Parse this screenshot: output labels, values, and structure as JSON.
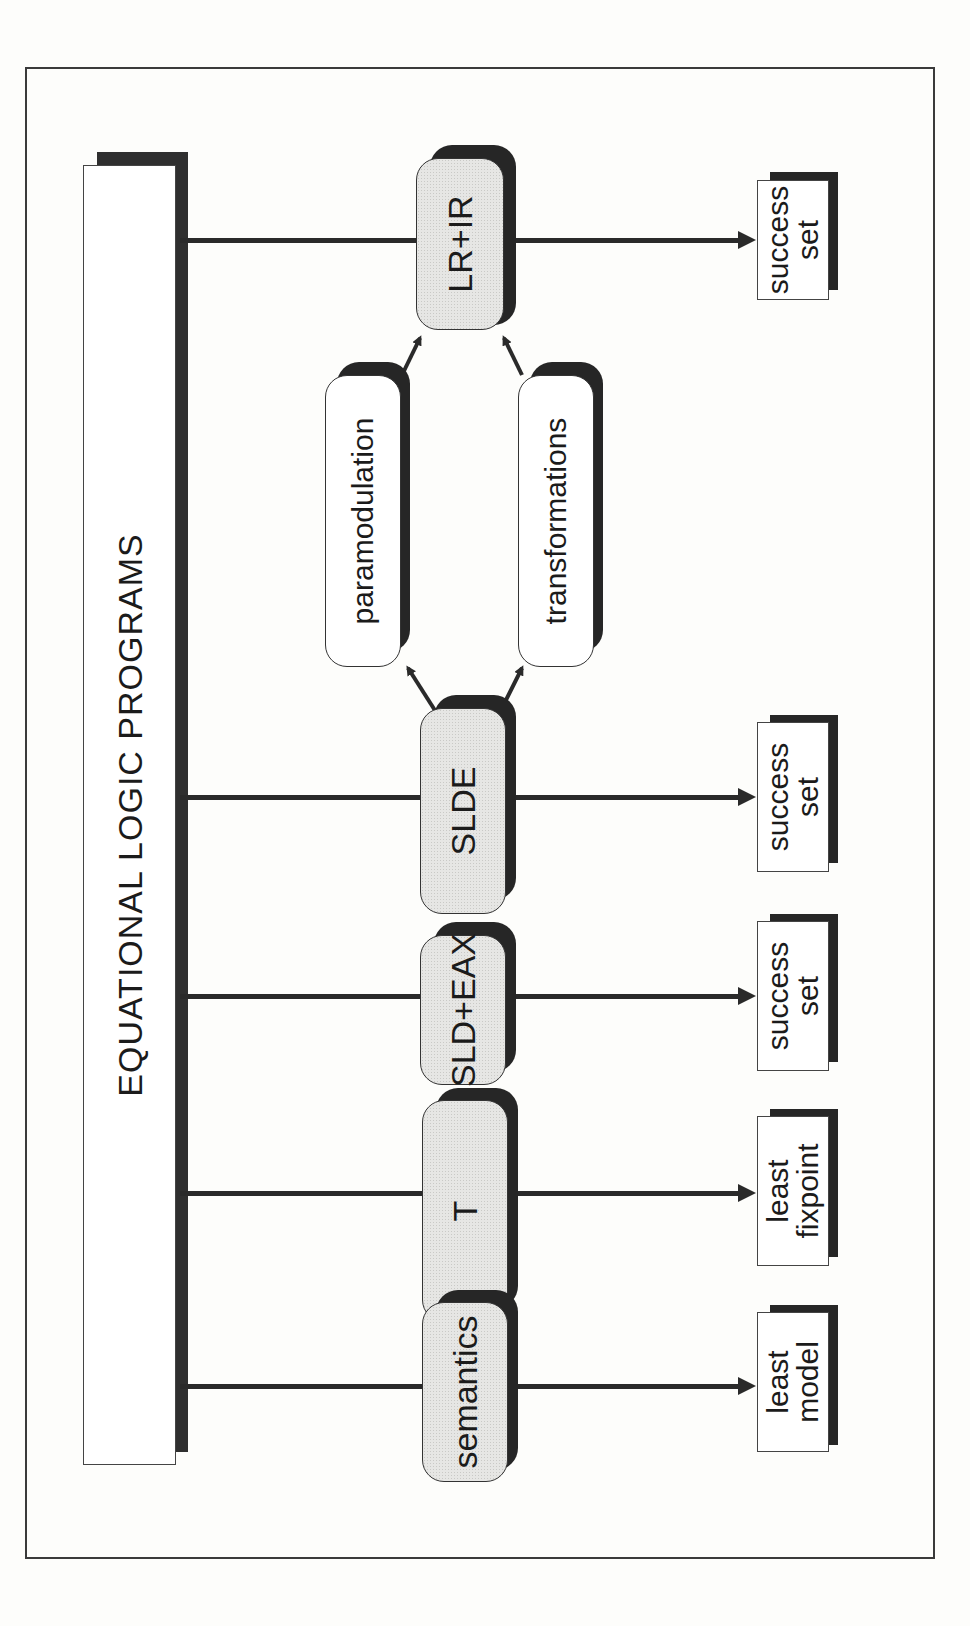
{
  "diagram": {
    "title": "EQUATIONAL LOGIC PROGRAMS",
    "orientation": "rotated 90 degrees counter-clockwise",
    "nodes": {
      "lr_ir": "LR+IR",
      "paramodulation": "paramodulation",
      "transformations": "transformations",
      "slde": "SLDE",
      "sld_eax": "SLD+EAX",
      "t": "T",
      "semantics": "semantics"
    },
    "results": {
      "lr_ir": [
        "success",
        "set"
      ],
      "slde": [
        "success",
        "set"
      ],
      "sld_eax": [
        "success",
        "set"
      ],
      "t": [
        "least",
        "fixpoint"
      ],
      "semantics": [
        "least",
        "model"
      ]
    },
    "edges": [
      {
        "from": "EQUATIONAL LOGIC PROGRAMS",
        "through": "LR+IR",
        "to": "success set"
      },
      {
        "from": "EQUATIONAL LOGIC PROGRAMS",
        "through": "SLDE",
        "to": "success set"
      },
      {
        "from": "EQUATIONAL LOGIC PROGRAMS",
        "through": "SLD+EAX",
        "to": "success set"
      },
      {
        "from": "EQUATIONAL LOGIC PROGRAMS",
        "through": "T",
        "to": "least fixpoint"
      },
      {
        "from": "EQUATIONAL LOGIC PROGRAMS",
        "through": "semantics",
        "to": "least model"
      },
      {
        "from": "SLDE",
        "to": "paramodulation"
      },
      {
        "from": "SLDE",
        "to": "transformations"
      },
      {
        "from": "paramodulation",
        "to": "LR+IR"
      },
      {
        "from": "transformations",
        "to": "LR+IR"
      }
    ],
    "colors": {
      "line": "#2a2a2a",
      "node_fill": "#e6e6e4",
      "shadow": "#262626",
      "paper": "#fdfdfb"
    }
  }
}
